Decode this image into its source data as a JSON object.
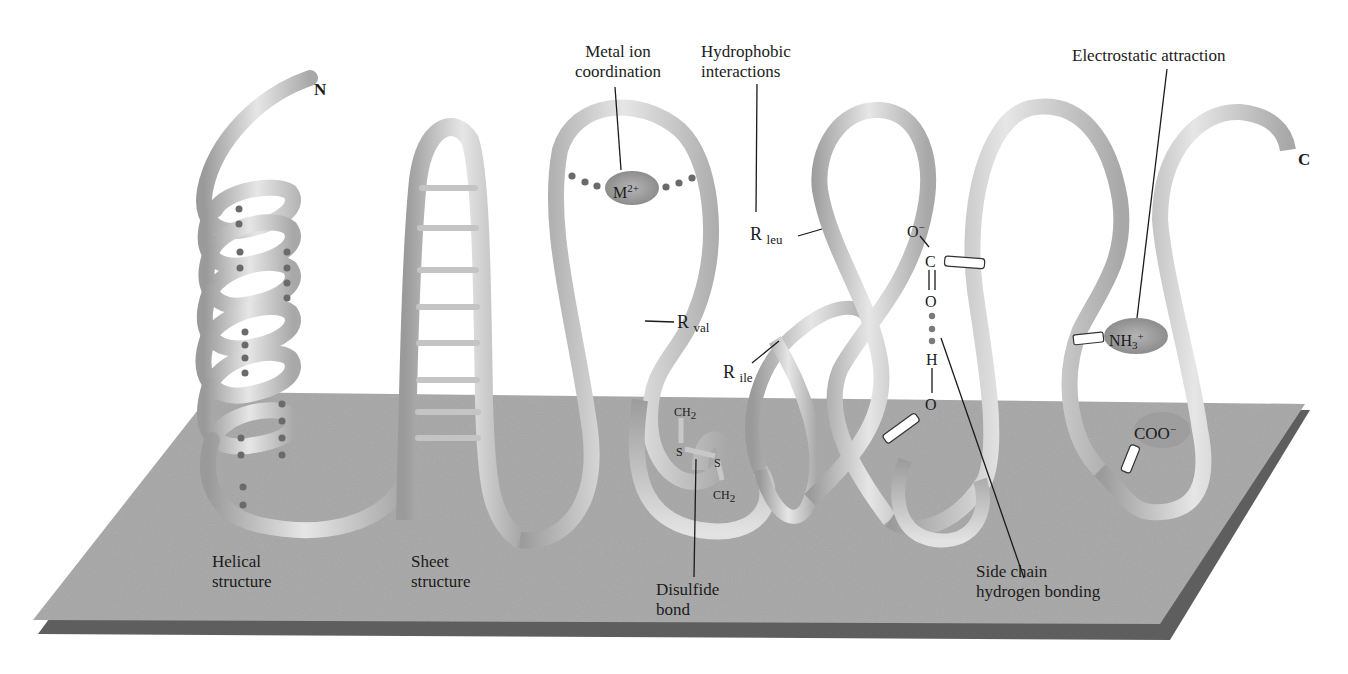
{
  "figure": {
    "termini": {
      "n": "N",
      "c": "C"
    },
    "top_labels": {
      "metal": {
        "line1": "Metal ion",
        "line2": "coordination"
      },
      "hydrophobic": {
        "line1": "Hydrophobic",
        "line2": "interactions"
      },
      "electrostatic": {
        "line1": "Electrostatic attraction"
      }
    },
    "bottom_labels": {
      "helical": {
        "line1": "Helical",
        "line2": "structure"
      },
      "sheet": {
        "line1": "Sheet",
        "line2": "structure"
      },
      "disulfide": {
        "line1": "Disulfide",
        "line2": "bond"
      },
      "hbond": {
        "line1": "Side chain",
        "line2": "hydrogen bonding"
      }
    },
    "chemistry": {
      "metal_ion": {
        "base": "M",
        "sup": "2+"
      },
      "r_leu": {
        "base": "R",
        "sub": "leu"
      },
      "r_val": {
        "base": "R",
        "sub": "val"
      },
      "r_ile": {
        "base": "R",
        "sub": "ile"
      },
      "ch2_top": {
        "base": "CH",
        "sub": "2"
      },
      "ch2_bottom": {
        "base": "CH",
        "sub": "2"
      },
      "s_left": "S",
      "s_right": "S",
      "carboxylate_o_minus": {
        "base": "O",
        "sup": "−"
      },
      "carboxylate_c": "C",
      "carbonyl_o": "O",
      "hydrogen": "H",
      "hydroxyl_o": "O",
      "ammonium": {
        "base": "NH",
        "sub": "3",
        "sup": "+"
      },
      "carboxylate_ion": {
        "base": "COO",
        "sup": "−"
      }
    },
    "colors": {
      "plane": "#a6a6a6",
      "plane_edge": "#5e5e5e",
      "ribbon_light": "#e4e4e4",
      "ribbon_dark": "#8f8f8f",
      "dot": "#6a6a6a",
      "ion_fill": "#8e8e8e",
      "leader_line": "#1a1a1a"
    }
  }
}
